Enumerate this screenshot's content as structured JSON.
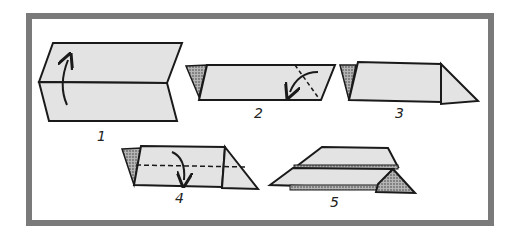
{
  "diagram": {
    "type": "instructional-folding-steps",
    "colors": {
      "frame": "#7a7a7a",
      "paper": "#e3e3e3",
      "outline": "#1a1a1a",
      "hatch": "#8a8a8a",
      "background": "#ffffff"
    },
    "steps": [
      {
        "number": "1",
        "action": "fold-up-along-center"
      },
      {
        "number": "2",
        "action": "fold-corner-diagonal"
      },
      {
        "number": "3",
        "action": "folded-corner-result"
      },
      {
        "number": "4",
        "action": "fold-down-along-dashed-line"
      },
      {
        "number": "5",
        "action": "finished-layered-shape"
      }
    ]
  }
}
